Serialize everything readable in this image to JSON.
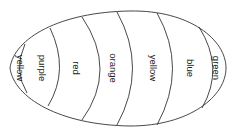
{
  "diagram": {
    "shape": "egg",
    "orientation": "horizontal",
    "bands": [
      {
        "label": "yellow",
        "cx": 20,
        "cy": 68
      },
      {
        "label": "purple",
        "cx": 42,
        "cy": 68
      },
      {
        "label": "red",
        "cx": 76,
        "cy": 68
      },
      {
        "label": "orange",
        "cx": 113,
        "cy": 68
      },
      {
        "label": "yellow",
        "cx": 153,
        "cy": 68
      },
      {
        "label": "blue",
        "cx": 190,
        "cy": 68
      },
      {
        "label": "green",
        "cx": 216,
        "cy": 68
      }
    ],
    "colors": {
      "stroke": "#333333",
      "text": "#222222",
      "background": "#ffffff"
    }
  }
}
